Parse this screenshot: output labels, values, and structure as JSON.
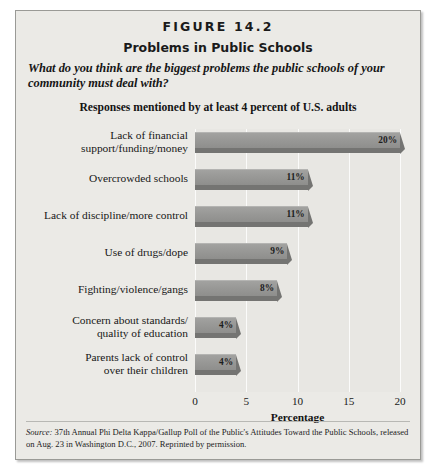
{
  "figure": {
    "number": "FIGURE 14.2",
    "title": "Problems in Public Schools",
    "question": "What do you think are the biggest problems the public schools of your community must deal with?",
    "subtitle": "Responses mentioned by at least 4 percent of U.S. adults",
    "source_word": "Source:",
    "source_text": " 37th Annual Phi Delta Kappa/Gallup Poll of the Public's Attitudes Toward the Public Schools, released on Aug. 23 in Washington D.C., 2007. Reprinted by permission."
  },
  "chart_data": {
    "type": "bar",
    "orientation": "horizontal",
    "title": "Problems in Public Schools",
    "subtitle": "Responses mentioned by at least 4 percent of U.S. adults",
    "xlabel": "Percentage",
    "ylabel": "",
    "xlim": [
      0,
      20
    ],
    "xticks": [
      0,
      5,
      10,
      15,
      20
    ],
    "xticklabels": [
      "0",
      "5",
      "10",
      "15",
      "20"
    ],
    "grid": true,
    "legend": false,
    "bar_color": "#98989 6",
    "categories": [
      "Lack of financial support/funding/money",
      "Overcrowded schools",
      "Lack of discipline/more control",
      "Use of drugs/dope",
      "Fighting/violence/gangs",
      "Concern about standards/quality of education",
      "Parents lack of control over their children"
    ],
    "category_lines": [
      [
        "Lack of financial",
        "support/funding/money"
      ],
      [
        "Overcrowded schools"
      ],
      [
        "Lack of discipline/more control"
      ],
      [
        "Use of drugs/dope"
      ],
      [
        "Fighting/violence/gangs"
      ],
      [
        "Concern about standards/",
        "quality of education"
      ],
      [
        "Parents lack of control",
        "over their children"
      ]
    ],
    "values": [
      20,
      11,
      11,
      9,
      8,
      4,
      4
    ],
    "data_labels": [
      "20%",
      "11%",
      "11%",
      "9%",
      "8%",
      "4%",
      "4%"
    ]
  },
  "colors": {
    "card_background": "#ebeae6",
    "plot_background": "#e8e7e3",
    "bar_fill": "#989896",
    "bar_shadow": "#747472",
    "gridline": "#fbfbfa",
    "text": "#1a1a1a"
  }
}
